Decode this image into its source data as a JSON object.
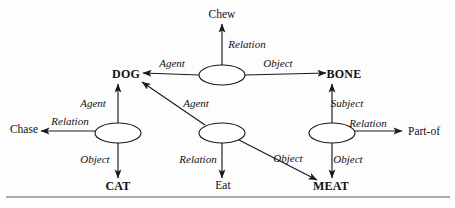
{
  "figure": {
    "background_color": "#fdfdfd",
    "stroke_color": "#1a1a1a",
    "rule_color": "#8f8f8f"
  },
  "nodes": {
    "relation_nodes": [
      {
        "id": "chew-node",
        "name": "chew-relation-node",
        "cx": 222,
        "cy": 75,
        "rx": 23,
        "ry": 10
      },
      {
        "id": "chase-node",
        "name": "chase-relation-node",
        "cx": 118,
        "cy": 133,
        "rx": 23,
        "ry": 10
      },
      {
        "id": "eat-node",
        "name": "eat-relation-node",
        "cx": 222,
        "cy": 133,
        "rx": 23,
        "ry": 10
      },
      {
        "id": "partof-node",
        "name": "part-of-relation-node",
        "cx": 332,
        "cy": 133,
        "rx": 23,
        "ry": 10
      }
    ],
    "entities": [
      {
        "id": "dog",
        "label": "DOG",
        "style": "entity",
        "x": 126,
        "y": 74
      },
      {
        "id": "bone",
        "label": "BONE",
        "style": "entity",
        "x": 344,
        "y": 74
      },
      {
        "id": "cat",
        "label": "CAT",
        "style": "entity",
        "x": 118,
        "y": 186
      },
      {
        "id": "meat",
        "label": "MEAT",
        "style": "entity",
        "x": 331,
        "y": 186
      }
    ],
    "concepts": [
      {
        "id": "chew",
        "label": "Chew",
        "style": "concept",
        "x": 222,
        "y": 15
      },
      {
        "id": "chase",
        "label": "Chase",
        "style": "concept",
        "x": 24,
        "y": 130
      },
      {
        "id": "eat",
        "label": "Eat",
        "style": "concept",
        "x": 223,
        "y": 186
      },
      {
        "id": "partof",
        "label": "Part-of",
        "style": "concept",
        "x": 424,
        "y": 132
      }
    ]
  },
  "edge_labels": [
    {
      "id": "chew-relation",
      "label": "Relation",
      "x": 247,
      "y": 44
    },
    {
      "id": "chew-agent",
      "label": "Agent",
      "x": 172,
      "y": 63
    },
    {
      "id": "chew-object",
      "label": "Object",
      "x": 278,
      "y": 63
    },
    {
      "id": "chase-agent",
      "label": "Agent",
      "x": 93,
      "y": 103
    },
    {
      "id": "chase-relation",
      "label": "Relation",
      "x": 70,
      "y": 121
    },
    {
      "id": "chase-object",
      "label": "Object",
      "x": 95,
      "y": 159
    },
    {
      "id": "eat-agent",
      "label": "Agent",
      "x": 196,
      "y": 103
    },
    {
      "id": "eat-relation",
      "label": "Relation",
      "x": 198,
      "y": 159
    },
    {
      "id": "eat-object",
      "label": "Object",
      "x": 288,
      "y": 158
    },
    {
      "id": "partof-subject",
      "label": "Subject",
      "x": 347,
      "y": 103
    },
    {
      "id": "partof-relation",
      "label": "Relation",
      "x": 368,
      "y": 123
    },
    {
      "id": "partof-object",
      "label": "Object",
      "x": 348,
      "y": 159
    }
  ],
  "edges": [
    {
      "id": "chew-to-chew",
      "from": "chew-node",
      "to": "chew",
      "role": "Relation",
      "direction": "up"
    },
    {
      "id": "chew-to-dog",
      "from": "chew-node",
      "to": "dog",
      "role": "Agent",
      "direction": "left"
    },
    {
      "id": "chew-to-bone",
      "from": "chew-node",
      "to": "bone",
      "role": "Object",
      "direction": "right"
    },
    {
      "id": "chase-to-dog",
      "from": "chase-node",
      "to": "dog",
      "role": "Agent",
      "direction": "up"
    },
    {
      "id": "chase-to-chase",
      "from": "chase-node",
      "to": "chase",
      "role": "Relation",
      "direction": "left"
    },
    {
      "id": "chase-to-cat",
      "from": "chase-node",
      "to": "cat",
      "role": "Object",
      "direction": "down"
    },
    {
      "id": "eat-to-dog",
      "from": "eat-node",
      "to": "dog",
      "role": "Agent",
      "direction": "up-left"
    },
    {
      "id": "eat-to-eat",
      "from": "eat-node",
      "to": "eat",
      "role": "Relation",
      "direction": "down"
    },
    {
      "id": "eat-to-meat",
      "from": "eat-node",
      "to": "meat",
      "role": "Object",
      "direction": "down-right"
    },
    {
      "id": "partof-to-bone",
      "from": "partof-node",
      "to": "bone",
      "role": "Subject",
      "direction": "up"
    },
    {
      "id": "partof-to-partof",
      "from": "partof-node",
      "to": "partof",
      "role": "Relation",
      "direction": "right"
    },
    {
      "id": "partof-to-meat",
      "from": "partof-node",
      "to": "meat",
      "role": "Object",
      "direction": "down"
    }
  ],
  "footer_rule": {
    "name": "horizontal-rule",
    "y": 197,
    "x1": 6,
    "x2": 450
  }
}
